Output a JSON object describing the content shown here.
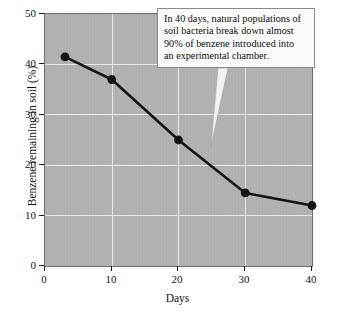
{
  "chart_data": {
    "type": "line",
    "title": "",
    "xlabel": "Days",
    "ylabel": "Benzene remaining in soil (%)",
    "xlim": [
      0,
      40
    ],
    "ylim": [
      0,
      50
    ],
    "xticks": [
      0,
      10,
      20,
      30,
      40
    ],
    "yticks": [
      0,
      10,
      20,
      30,
      40,
      50
    ],
    "grid": true,
    "legend": false,
    "x": [
      3,
      10,
      20,
      30,
      40
    ],
    "values": [
      41.5,
      37,
      25,
      14.5,
      12
    ],
    "series": [
      {
        "name": "Benzene remaining in soil",
        "x": [
          3,
          10,
          20,
          30,
          40
        ],
        "values": [
          41.5,
          37,
          25,
          14.5,
          12
        ]
      }
    ],
    "annotations": [
      {
        "text": "In 40 days, natural populations of soil bacteria break down almost 90% of benzene introduced into an experimental chamber.",
        "lines": [
          "In 40 days, natural populations of",
          "soil bacteria break down almost",
          "90% of benzene introduced into",
          "an experimental chamber."
        ],
        "points_to_x": 23,
        "points_to_y": 24
      }
    ],
    "colors": {
      "plot_background": "#b4b4b4",
      "gridline": "#e8e8e8",
      "line": "#141414",
      "marker": "#141414",
      "axis": "#1c1c1c",
      "annotation_background": "#fbfbfb",
      "annotation_border": "#8a8a8a",
      "annotation_pointer": "#f2f2f2"
    }
  },
  "axes": {
    "y_tick_labels": [
      "0",
      "10",
      "20",
      "30",
      "40",
      "50"
    ],
    "x_tick_labels": [
      "0",
      "10",
      "20",
      "30",
      "40"
    ]
  }
}
